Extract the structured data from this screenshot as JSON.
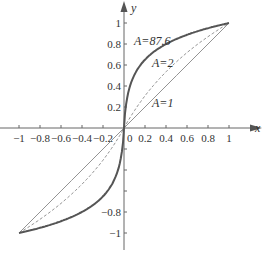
{
  "chart_data": {
    "type": "line",
    "title": "",
    "xlabel": "x",
    "ylabel": "y",
    "xlim": [
      -1,
      1
    ],
    "ylim": [
      -1,
      1
    ],
    "grid": false,
    "x_ticks": [
      "-1",
      "-0.8",
      "-0.6",
      "-0.4",
      "-0.2",
      "0",
      "0.2",
      "0.4",
      "0.6",
      "0.8",
      "1"
    ],
    "y_ticks_positive": [
      "0.2",
      "0.4",
      "0.6",
      "0.8",
      "1"
    ],
    "y_ticks_negative": [
      "-0.8",
      "-1"
    ],
    "series": [
      {
        "name": "A=1",
        "label": "A=1",
        "style": "solid-thin",
        "A": 1,
        "x": [
          -1,
          -0.5,
          0,
          0.5,
          1
        ],
        "y": [
          -1,
          -0.5,
          0,
          0.5,
          1
        ]
      },
      {
        "name": "A=2",
        "label": "A=2",
        "style": "dashed",
        "A": 2,
        "x": [
          -1,
          -0.5,
          0,
          0.5,
          1
        ],
        "y": [
          -1,
          -0.58,
          0,
          0.58,
          1
        ]
      },
      {
        "name": "A=87.6",
        "label": "A=87.6",
        "style": "solid-thick",
        "A": 87.6,
        "x": [
          -1,
          -0.8,
          -0.6,
          -0.4,
          -0.2,
          -0.1,
          -0.05,
          0,
          0.05,
          0.1,
          0.2,
          0.4,
          0.6,
          0.8,
          1
        ],
        "y": [
          -1,
          -0.95,
          -0.9,
          -0.82,
          -0.71,
          -0.6,
          -0.45,
          0,
          0.45,
          0.6,
          0.71,
          0.82,
          0.9,
          0.95,
          1
        ]
      }
    ],
    "annotations": [
      {
        "text": "A=87.6",
        "x": 0.1,
        "y": 0.86
      },
      {
        "text": "A=2",
        "x": 0.27,
        "y": 0.6
      },
      {
        "text": "A=1",
        "x": 0.3,
        "y": 0.2
      }
    ]
  },
  "labels": {
    "x_axis": "x",
    "y_axis": "y",
    "ann_a876": "A=87.6",
    "ann_a2": "A=2",
    "ann_a1": "A=1"
  }
}
